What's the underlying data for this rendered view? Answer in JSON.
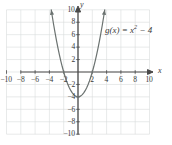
{
  "figure": {
    "kind": "cartesian-graph",
    "background_color": "#ffffff",
    "width": 172,
    "height": 145
  },
  "chart_data": {
    "type": "line",
    "title": "",
    "subtitle": "",
    "xlabel": "x",
    "ylabel": "y",
    "xlim": [
      -10,
      10
    ],
    "ylim": [
      -10,
      10
    ],
    "grid": true,
    "grid_step": 2,
    "grid_color": "#d9dcdb",
    "axis_color": "#4a4a4a",
    "legend": "none",
    "annotations": [
      {
        "text": "g(x) = x² − 4",
        "x": 4.5,
        "y": 7
      }
    ],
    "xticks": [
      -10,
      -8,
      -6,
      -4,
      -2,
      2,
      4,
      6,
      8,
      10
    ],
    "xticklabels": [
      "−10",
      "−8",
      "−6",
      "−4",
      "−2",
      "2",
      "4",
      "6",
      "8",
      "10"
    ],
    "yticks": [
      10,
      8,
      6,
      4,
      2,
      -2,
      -4,
      -6,
      -8,
      -10
    ],
    "yticklabels": [
      "10",
      "8",
      "6",
      "4",
      "2",
      "−2",
      "−4",
      "−6",
      "−8",
      "−10"
    ],
    "series": [
      {
        "name": "g(x) = x² − 4",
        "equation": "y = x^2 - 4",
        "color": "#6b7270",
        "vertex": [
          0,
          -4
        ],
        "x_intercepts": [
          -2,
          2
        ],
        "y_intercept": -4,
        "arrows": "both-ends",
        "x": [
          -3.742,
          -3.6,
          -3.4,
          -3.2,
          -3.0,
          -2.8,
          -2.6,
          -2.4,
          -2.2,
          -2.0,
          -1.8,
          -1.6,
          -1.4,
          -1.2,
          -1.0,
          -0.8,
          -0.6,
          -0.4,
          -0.2,
          0,
          0.2,
          0.4,
          0.6,
          0.8,
          1.0,
          1.2,
          1.4,
          1.6,
          1.8,
          2.0,
          2.2,
          2.4,
          2.6,
          2.8,
          3.0,
          3.2,
          3.4,
          3.6,
          3.742
        ],
        "values": [
          10.0,
          8.96,
          7.56,
          6.24,
          5.0,
          3.84,
          2.76,
          1.76,
          0.84,
          0,
          -0.76,
          -1.44,
          -2.04,
          -2.56,
          -3.0,
          -3.36,
          -3.64,
          -3.84,
          -3.96,
          -4.0,
          -3.96,
          -3.84,
          -3.64,
          -3.36,
          -3.0,
          -2.56,
          -2.04,
          -1.44,
          -0.76,
          0,
          0.84,
          1.76,
          2.76,
          3.84,
          5.0,
          6.24,
          7.56,
          8.96,
          10.0
        ]
      }
    ]
  },
  "labels": {
    "x_axis_name": "x",
    "y_axis_name": "y",
    "function_text_prefix": "g(x) = x",
    "function_text_exponent": "2",
    "function_text_suffix": " − 4"
  }
}
